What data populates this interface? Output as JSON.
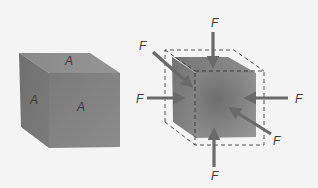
{
  "figure": {
    "left_cube": {
      "description": "Cube with area A on each visible face",
      "face_labels": {
        "top": "A",
        "side": "A",
        "front": "A"
      }
    },
    "right_cube": {
      "description": "Cube compressed by forces F on all faces, dashed outline shows original size",
      "force_labels": {
        "top": "F",
        "back_left": "F",
        "left": "F",
        "right": "F",
        "front_right": "F",
        "bottom": "F"
      }
    },
    "colors": {
      "background": "#f4f4f4",
      "cube_front": "#7d7d7d",
      "cube_top": "#8e8e8e",
      "cube_side": "#737373",
      "arrow": "#6a6a6a",
      "dashed_outline": "#2a2a2a"
    }
  }
}
